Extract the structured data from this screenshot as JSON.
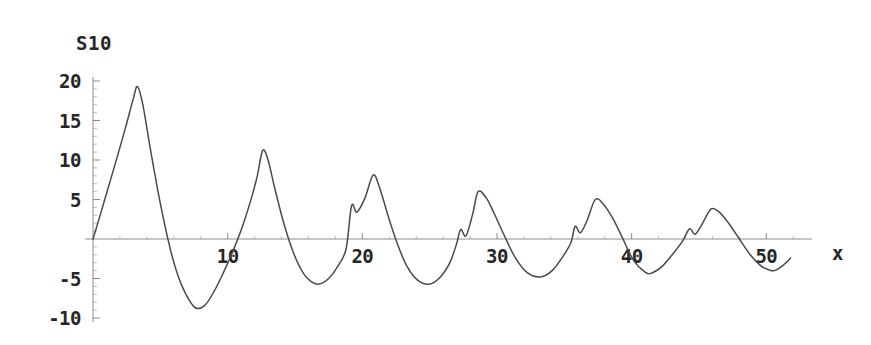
{
  "chart_data": {
    "type": "line",
    "title": "S10",
    "xlabel": "x",
    "ylabel": "",
    "xlim": [
      0,
      52.5
    ],
    "ylim": [
      -10.5,
      20.5
    ],
    "grid": false,
    "legend": false,
    "legend_position": "none",
    "x_ticks": [
      10,
      20,
      30,
      40,
      50
    ],
    "x_tick_labels": [
      "10",
      "20",
      "30",
      "40",
      "50"
    ],
    "x_minor_tick_step": 2,
    "y_ticks": [
      20,
      15,
      10,
      5,
      -5,
      -10
    ],
    "y_tick_labels": [
      "20",
      "15",
      "10",
      "5",
      "-5",
      "-10"
    ],
    "y_minor_tick_step": 1,
    "series": [
      {
        "name": "S10",
        "color": "#4a4a4a",
        "description": "Decaying oscillation: truncated Fourier partial sum with Gibbs ripples before each peak",
        "peaks": [
          {
            "x": 3.3,
            "y": 19.3
          },
          {
            "x": 12.6,
            "y": 11.2
          },
          {
            "x": 20.8,
            "y": 8.1
          },
          {
            "x": 28.6,
            "y": 6.0
          },
          {
            "x": 37.3,
            "y": 5.0
          },
          {
            "x": 45.9,
            "y": 3.8
          }
        ],
        "troughs": [
          {
            "x": 7.6,
            "y": -8.7
          },
          {
            "x": 16.8,
            "y": -5.7
          },
          {
            "x": 25.0,
            "y": -5.7
          },
          {
            "x": 33.2,
            "y": -4.8
          },
          {
            "x": 41.5,
            "y": -4.3
          },
          {
            "x": 50.6,
            "y": -4.0
          }
        ],
        "ripple_shoulders": [
          {
            "x": 19.2,
            "y": 4.2
          },
          {
            "x": 27.3,
            "y": 1.2
          },
          {
            "x": 35.8,
            "y": 1.6
          },
          {
            "x": 44.3,
            "y": 1.3
          }
        ],
        "x": [
          0,
          0.6,
          1.2,
          1.8,
          2.4,
          3.0,
          3.3,
          3.7,
          4.3,
          5.0,
          5.7,
          6.3,
          6.9,
          7.6,
          8.3,
          9.0,
          9.7,
          10.4,
          11.1,
          11.8,
          12.2,
          12.6,
          13.0,
          13.5,
          14.2,
          14.9,
          15.6,
          16.2,
          16.8,
          17.5,
          18.2,
          18.8,
          19.2,
          19.6,
          20.2,
          20.8,
          21.3,
          21.9,
          22.6,
          23.3,
          24.1,
          25.0,
          25.8,
          26.5,
          27.0,
          27.3,
          27.7,
          28.2,
          28.6,
          29.2,
          29.8,
          30.5,
          31.3,
          32.2,
          33.2,
          34.1,
          34.9,
          35.5,
          35.8,
          36.2,
          36.7,
          37.3,
          37.9,
          38.6,
          39.3,
          40.1,
          41.0,
          41.5,
          42.3,
          43.1,
          43.8,
          44.3,
          44.7,
          45.2,
          45.9,
          46.5,
          47.2,
          48.0,
          48.8,
          49.6,
          50.2,
          50.6,
          51.2,
          51.8
        ],
        "y": [
          0.0,
          3.4,
          6.9,
          10.4,
          14.0,
          17.8,
          19.3,
          17.0,
          11.0,
          4.5,
          -1.0,
          -4.6,
          -7.0,
          -8.7,
          -8.4,
          -6.6,
          -4.2,
          -1.5,
          1.6,
          5.4,
          8.0,
          11.2,
          10.0,
          6.4,
          1.8,
          -1.8,
          -4.3,
          -5.4,
          -5.7,
          -5.0,
          -3.4,
          -1.2,
          4.2,
          3.4,
          5.2,
          8.1,
          6.4,
          3.0,
          -0.6,
          -3.4,
          -5.2,
          -5.7,
          -4.8,
          -3.0,
          -0.6,
          1.2,
          0.4,
          3.2,
          6.0,
          5.2,
          3.2,
          0.6,
          -2.2,
          -4.2,
          -4.8,
          -4.0,
          -2.2,
          -0.4,
          1.6,
          0.8,
          2.4,
          5.0,
          4.4,
          2.6,
          0.2,
          -2.6,
          -4.2,
          -4.3,
          -3.4,
          -1.8,
          -0.2,
          1.3,
          0.6,
          1.8,
          3.8,
          3.4,
          2.0,
          0.0,
          -2.0,
          -3.4,
          -3.9,
          -4.0,
          -3.4,
          -2.4
        ]
      }
    ]
  },
  "axis_style": {
    "axis_color": "#8d8d8d",
    "curve_color": "#4a4a4a",
    "text_color": "#262626",
    "background": "#ffffff"
  }
}
